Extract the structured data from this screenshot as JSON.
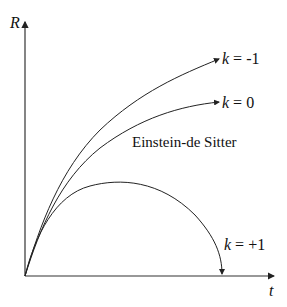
{
  "axes": {
    "y_label": "R",
    "x_label": "t"
  },
  "curves": [
    {
      "id": "open",
      "label_var": "k",
      "label_eq": " = -1"
    },
    {
      "id": "flat",
      "label_var": "k",
      "label_eq": " = 0",
      "name": "Einstein-de Sitter"
    },
    {
      "id": "closed",
      "label_var": "k",
      "label_eq": " = +1"
    }
  ],
  "colors": {
    "line": "#222222",
    "background": "#ffffff"
  }
}
